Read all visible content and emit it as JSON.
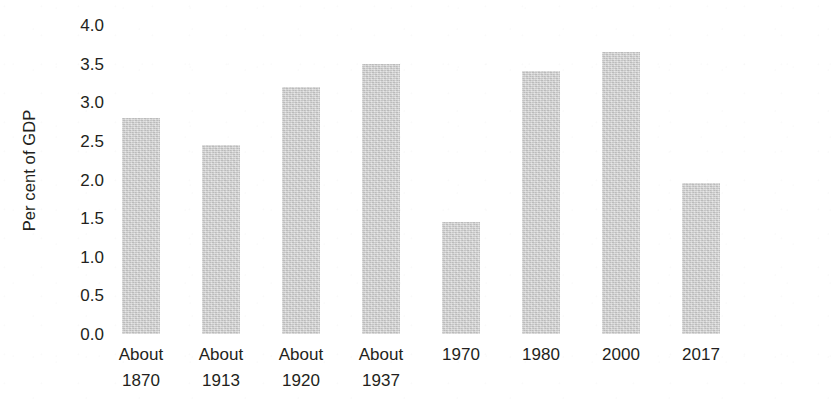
{
  "chart_data": {
    "type": "bar",
    "title": "",
    "subtitle": "",
    "xlabel": "",
    "ylabel": "Per cent of GDP",
    "ylim": [
      0.0,
      4.0
    ],
    "ytick_labels": [
      "0.0",
      "0.5",
      "1.0",
      "1.5",
      "2.0",
      "2.5",
      "3.0",
      "3.5",
      "4.0"
    ],
    "ytick_values": [
      0.0,
      0.5,
      1.0,
      1.5,
      2.0,
      2.5,
      3.0,
      3.5,
      4.0
    ],
    "grid": false,
    "legend": "none",
    "bar_color": "#cdcdcd",
    "categories": [
      "About 1870",
      "About 1913",
      "About 1920",
      "About 1937",
      "1970",
      "1980",
      "2000",
      "2017"
    ],
    "category_lines": [
      [
        "About",
        "1870"
      ],
      [
        "About",
        "1913"
      ],
      [
        "About",
        "1920"
      ],
      [
        "About",
        "1937"
      ],
      [
        "1970",
        ""
      ],
      [
        "1980",
        ""
      ],
      [
        "2000",
        ""
      ],
      [
        "2017",
        ""
      ]
    ],
    "values": [
      2.8,
      2.45,
      3.2,
      3.5,
      1.45,
      3.4,
      3.65,
      1.95
    ]
  }
}
